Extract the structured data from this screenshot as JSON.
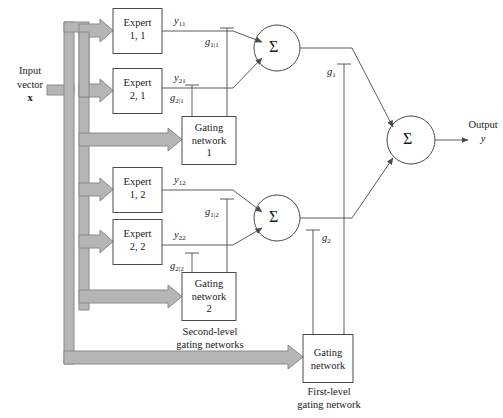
{
  "figure": {
    "type": "block-diagram"
  },
  "input": {
    "line1": "Input",
    "line2": "vector",
    "line3": "x"
  },
  "output": {
    "line1": "Output",
    "line2": "y"
  },
  "experts": [
    {
      "id": "expert-1-1",
      "line1": "Expert",
      "line2": "1, 1",
      "output_label": "y",
      "output_sub": "11"
    },
    {
      "id": "expert-2-1",
      "line1": "Expert",
      "line2": "2, 1",
      "output_label": "y",
      "output_sub": "21"
    },
    {
      "id": "expert-1-2",
      "line1": "Expert",
      "line2": "1, 2",
      "output_label": "y",
      "output_sub": "12"
    },
    {
      "id": "expert-2-2",
      "line1": "Expert",
      "line2": "2, 2",
      "output_label": "y",
      "output_sub": "22"
    }
  ],
  "gating_networks": [
    {
      "id": "gating-network-1",
      "line1": "Gating",
      "line2": "network",
      "line3": "1"
    },
    {
      "id": "gating-network-2",
      "line1": "Gating",
      "line2": "network",
      "line3": "2"
    },
    {
      "id": "gating-network-first-level",
      "line1": "Gating",
      "line2": "network",
      "line3": ""
    }
  ],
  "gate_signals": [
    {
      "id": "g-1-given-1",
      "symbol": "g",
      "sub": "1|1"
    },
    {
      "id": "g-2-given-1",
      "symbol": "g",
      "sub": "2|1"
    },
    {
      "id": "g-1-given-2",
      "symbol": "g",
      "sub": "1|2"
    },
    {
      "id": "g-2-given-2",
      "symbol": "g",
      "sub": "2|2"
    },
    {
      "id": "g-1",
      "symbol": "g",
      "sub": "1"
    },
    {
      "id": "g-2",
      "symbol": "g",
      "sub": "2"
    }
  ],
  "summers": [
    {
      "id": "summer-top",
      "glyph": "Σ"
    },
    {
      "id": "summer-bottom",
      "glyph": "Σ"
    },
    {
      "id": "summer-output",
      "glyph": "Σ"
    }
  ],
  "captions": {
    "second_level_line1": "Second-level",
    "second_level_line2": "gating networks",
    "first_level_line1": "First-level",
    "first_level_line2": "gating network"
  },
  "colors": {
    "line": "#4a4a4a",
    "bus_fill": "#b5b5b5",
    "bus_stroke": "#8a8a8a",
    "text": "#1a1a1a",
    "background": "#ffffff"
  }
}
